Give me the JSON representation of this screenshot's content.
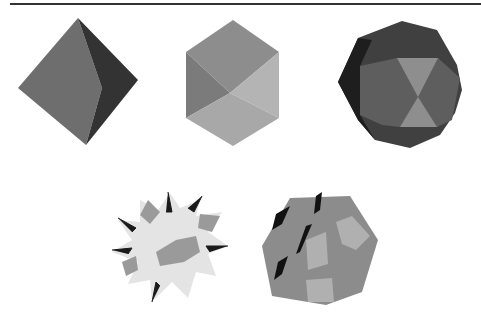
{
  "figure": {
    "shapes": [
      {
        "id": "octahedron",
        "name": "Octahedron",
        "colors": {
          "light": "#6e6e6e",
          "dark": "#333333"
        }
      },
      {
        "id": "rhombic-hexagon",
        "name": "Cube-like hexagonal solid",
        "colors": {
          "top": "#8d8d8d",
          "left": "#7b7b7b",
          "right": "#b4b4b4",
          "bottom": "#a8a8a8"
        }
      },
      {
        "id": "truncated-solid",
        "name": "Rounded polyhedron",
        "colors": {
          "outer": "#404040",
          "rim": "#1e1e1e",
          "mid": "#5e5e5e",
          "center": "#8e8e8e"
        }
      },
      {
        "id": "stellated",
        "name": "Spiky stellated polyhedron",
        "colors": {
          "face": "#e4e4e4",
          "shade": "#9a9a9a",
          "spike": "#1a1a1a"
        }
      },
      {
        "id": "compound",
        "name": "Compound polyhedron",
        "colors": {
          "base": "#8c8c8c",
          "light": "#b0b0b0",
          "dark": "#111111"
        }
      }
    ]
  }
}
